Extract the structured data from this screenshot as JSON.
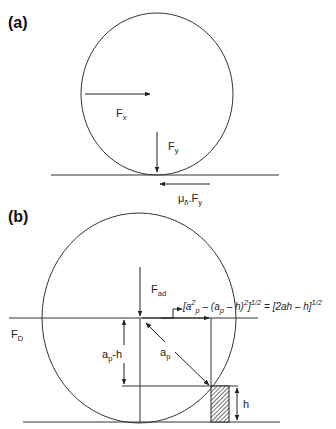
{
  "panel_a": {
    "label": "(a)",
    "force_x": {
      "main": "F",
      "sub": "x"
    },
    "force_y": {
      "main": "F",
      "sub": "y"
    },
    "friction": {
      "mu": "μ",
      "mu_sub": "δ",
      "dot": ".",
      "main": "F",
      "sub": "y"
    }
  },
  "panel_b": {
    "label": "(b)",
    "adhesion": {
      "main": "F",
      "sub": "ad"
    },
    "drag": {
      "main": "F",
      "sub": "D"
    },
    "lever_vertical": {
      "a": "a",
      "sub": "p",
      "rest": "-h"
    },
    "radius": {
      "main": "a",
      "sub": "p"
    },
    "height": "h",
    "formula": {
      "p1": "[a",
      "sup2": "2",
      "subp": "p",
      "p2": " – (a",
      "subp2": "p",
      "p3": " – h)",
      "sup2b": "2",
      "p4": "]",
      "sup_half": "1/2",
      "p5": " = [2ah – h]",
      "sup_half2": "1/2"
    }
  }
}
